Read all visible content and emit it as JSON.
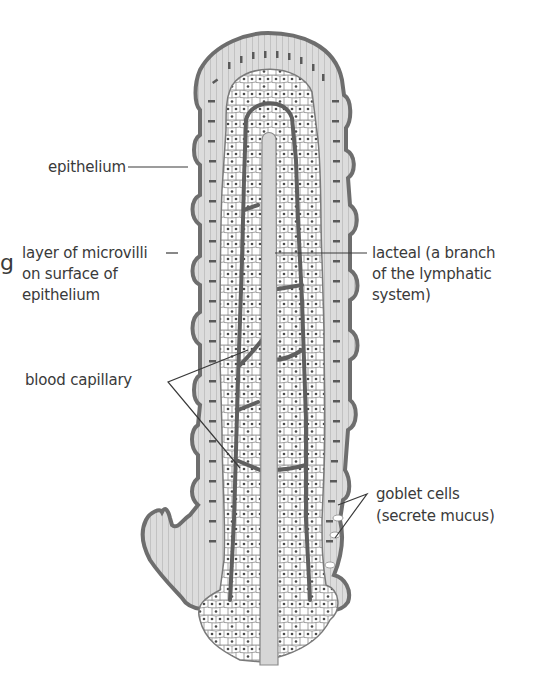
{
  "diagram": {
    "colors": {
      "outline": "#6e6e6e",
      "epithelium_fill": "#d9d9d9",
      "nucleus": "#5a5a5a",
      "capillary": "#5f5f5f",
      "lacteal_fill": "#d6d6d6",
      "cell_outline": "#8a8a8a",
      "background": "#ffffff",
      "label_text": "#3a3a3a"
    },
    "labels": {
      "epithelium": "epithelium",
      "microvilli_line1": "layer of microvilli",
      "microvilli_line2": "on surface of",
      "microvilli_line3": "epithelium",
      "blood_capillary": "blood capillary",
      "lacteal_line1": "lacteal (a branch",
      "lacteal_line2": "of the lymphatic",
      "lacteal_line3": "system)",
      "goblet_line1": "goblet cells",
      "goblet_line2": "(secrete mucus)"
    },
    "edge_fragments": {
      "left_cut_glyph": "g"
    }
  }
}
